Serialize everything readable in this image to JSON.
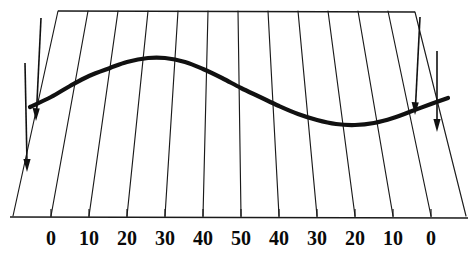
{
  "figure": {
    "title": "",
    "background_color": "#ffffff",
    "ink_color": "#111111",
    "curve_color": "#111111"
  },
  "axis": {
    "name": "bottom-scale",
    "labels": [
      "0",
      "10",
      "20",
      "30",
      "40",
      "50",
      "40",
      "30",
      "20",
      "10",
      "0"
    ],
    "label_x": [
      51,
      89,
      127,
      165,
      203,
      241,
      279,
      317,
      355,
      393,
      431
    ],
    "baseline_y": 217,
    "tick_length": 9
  },
  "grid": {
    "type": "fan",
    "line_color": "#1a1a1a",
    "line_width": 1.1,
    "top_y": 11,
    "bottom_y": 216,
    "top_x": [
      58,
      88,
      118,
      148,
      178,
      208,
      238,
      268,
      298,
      328,
      358,
      388,
      415
    ],
    "bottom_x": [
      13,
      51,
      89,
      127,
      165,
      203,
      241,
      279,
      317,
      355,
      393,
      431,
      466
    ],
    "top_edge": {
      "left_x": 58,
      "right_x": 415,
      "y": 11
    },
    "bottom_edge": {
      "left_x": 13,
      "right_x": 468,
      "y": 217
    }
  },
  "chart_data": {
    "type": "line",
    "title": "",
    "xlabel": "",
    "ylabel": "",
    "grid": true,
    "legend": "none",
    "series": [
      {
        "name": "curve",
        "points_px": [
          [
            30,
            107
          ],
          [
            51,
            97
          ],
          [
            70,
            86
          ],
          [
            89,
            76
          ],
          [
            110,
            68
          ],
          [
            127,
            62
          ],
          [
            148,
            58
          ],
          [
            165,
            58
          ],
          [
            185,
            62
          ],
          [
            203,
            69
          ],
          [
            222,
            78
          ],
          [
            241,
            88
          ],
          [
            260,
            97
          ],
          [
            279,
            106
          ],
          [
            298,
            114
          ],
          [
            317,
            120
          ],
          [
            336,
            124
          ],
          [
            355,
            125
          ],
          [
            374,
            123
          ],
          [
            393,
            118
          ],
          [
            412,
            111
          ],
          [
            431,
            104
          ],
          [
            448,
            98
          ]
        ],
        "line_width": 4.2
      }
    ]
  },
  "annotations": {
    "arrows": [
      {
        "name": "left-outer-arrow",
        "x1": 25,
        "y1": 63,
        "x2": 27,
        "y2": 168,
        "head": "down"
      },
      {
        "name": "left-inner-arrow",
        "x1": 41,
        "y1": 18,
        "x2": 36,
        "y2": 118,
        "head": "down"
      },
      {
        "name": "right-inner-arrow",
        "x1": 420,
        "y1": 17,
        "x2": 415,
        "y2": 112,
        "head": "down"
      },
      {
        "name": "right-outer-arrow",
        "x1": 437,
        "y1": 51,
        "x2": 437,
        "y2": 128,
        "head": "down"
      }
    ]
  }
}
